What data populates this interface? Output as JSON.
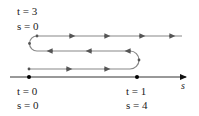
{
  "labels": {
    "top_t": "t = 3",
    "top_s": "s = 0",
    "left_t": "t = 0",
    "left_s": "s = 0",
    "right_t": "t = 1",
    "right_s": "s = 4",
    "axis": "s"
  },
  "colors": {
    "path": "#777777",
    "axis": "#333333",
    "dot": "#000000"
  }
}
